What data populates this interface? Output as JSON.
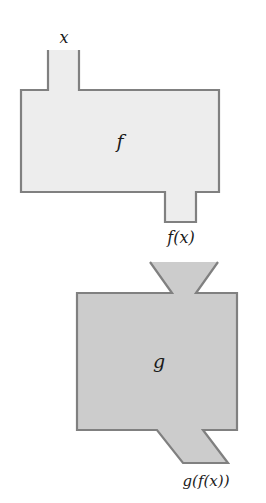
{
  "diagram": {
    "type": "function-machine-composition",
    "background_color": "#ffffff",
    "outline_color": "#808080",
    "text_color": "#1a1a1a",
    "machines": [
      {
        "id": "f",
        "label": "f",
        "fill_color": "#ededed",
        "input_label": "x",
        "output_label": "f(x)",
        "box": {
          "x": 21,
          "y": 90,
          "width": 198,
          "height": 102
        },
        "input_stem": {
          "x": 48,
          "y": 50,
          "width": 31
        },
        "output_stem": {
          "x": 165,
          "y": 222,
          "width": 31
        }
      },
      {
        "id": "g",
        "label": "g",
        "fill_color": "#cccccc",
        "input_label": "f(x)",
        "output_label": "g(f(x))",
        "box": {
          "x": 77,
          "y": 293,
          "width": 160,
          "height": 137
        },
        "input_funnel": {
          "top_left": 150,
          "top_right": 218,
          "bottom_left": 172,
          "bottom_right": 196,
          "top_y": 262,
          "bottom_y": 293
        },
        "output_chute": {
          "top_left": 157,
          "top_right": 203,
          "bottom_left": 183,
          "bottom_right": 228,
          "top_y": 430,
          "bottom_y": 463
        }
      }
    ],
    "labels": {
      "input_x": "x",
      "machine_f": "f",
      "intermediate_fx": "f(x)",
      "machine_g": "g",
      "output_gfx": "g(f(x))"
    }
  }
}
